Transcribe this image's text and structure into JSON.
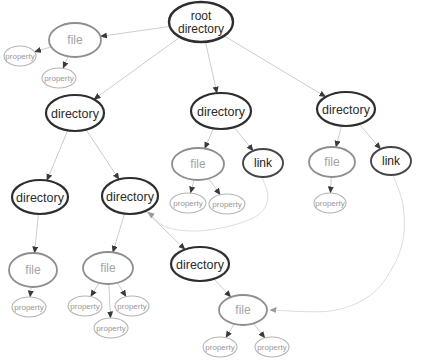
{
  "diagram": {
    "type": "graph",
    "background": "#ffffff",
    "styles": {
      "root": {
        "stroke": "#2e2e2e",
        "width": 2.4,
        "text": "#2b2b2b",
        "font": 12
      },
      "directory": {
        "stroke": "#2e2e2e",
        "width": 2.2,
        "text": "#2b2b2b",
        "font": 12.5
      },
      "file": {
        "stroke": "#8e8e8e",
        "width": 1.8,
        "text": "#a3a3a3",
        "font": 12
      },
      "link": {
        "stroke": "#454545",
        "width": 1.9,
        "text": "#222222",
        "font": 12
      },
      "property": {
        "stroke": "#b4b4b4",
        "width": 1.1,
        "text": "#979797",
        "font": 8
      }
    },
    "edge_style": {
      "stroke": "#c6c6c6",
      "width": 0.9,
      "arrow": "#3a3a3a"
    },
    "link_edge_style": {
      "stroke": "#d8d8d8",
      "width": 0.9,
      "arrow": "#9a9a9a"
    },
    "nodes": [
      {
        "id": "root",
        "type": "root",
        "label": "root directory",
        "lines": [
          "root",
          "directory"
        ],
        "x": 201,
        "y": 22,
        "rx": 32,
        "ry": 20
      },
      {
        "id": "file-1",
        "type": "file",
        "label": "file",
        "x": 75,
        "y": 40,
        "rx": 26,
        "ry": 17
      },
      {
        "id": "property-1a",
        "type": "property",
        "label": "property",
        "x": 20,
        "y": 56,
        "rx": 16,
        "ry": 10
      },
      {
        "id": "property-1b",
        "type": "property",
        "label": "property",
        "x": 59,
        "y": 78,
        "rx": 17,
        "ry": 10
      },
      {
        "id": "directory-1",
        "type": "directory",
        "label": "directory",
        "x": 75,
        "y": 113,
        "rx": 29,
        "ry": 18
      },
      {
        "id": "directory-2",
        "type": "directory",
        "label": "directory",
        "x": 221,
        "y": 111,
        "rx": 30,
        "ry": 18
      },
      {
        "id": "directory-3",
        "type": "directory",
        "label": "directory",
        "x": 346,
        "y": 109,
        "rx": 29,
        "ry": 17
      },
      {
        "id": "directory-4",
        "type": "directory",
        "label": "directory",
        "x": 40,
        "y": 197,
        "rx": 28,
        "ry": 17
      },
      {
        "id": "directory-5",
        "type": "directory",
        "label": "directory",
        "x": 130,
        "y": 196,
        "rx": 28,
        "ry": 18
      },
      {
        "id": "file-2",
        "type": "file",
        "label": "file",
        "x": 198,
        "y": 164,
        "rx": 26,
        "ry": 16
      },
      {
        "id": "link-1",
        "type": "link",
        "label": "link",
        "x": 263,
        "y": 163,
        "rx": 20,
        "ry": 14
      },
      {
        "id": "file-3",
        "type": "file",
        "label": "file",
        "x": 332,
        "y": 162,
        "rx": 23,
        "ry": 15
      },
      {
        "id": "link-2",
        "type": "link",
        "label": "link",
        "x": 391,
        "y": 161,
        "rx": 20,
        "ry": 14
      },
      {
        "id": "property-2a",
        "type": "property",
        "label": "property",
        "x": 188,
        "y": 203,
        "rx": 18,
        "ry": 10
      },
      {
        "id": "property-2b",
        "type": "property",
        "label": "property",
        "x": 227,
        "y": 204,
        "rx": 18,
        "ry": 10
      },
      {
        "id": "property-3a",
        "type": "property",
        "label": "property",
        "x": 330,
        "y": 203,
        "rx": 16,
        "ry": 10
      },
      {
        "id": "file-4",
        "type": "file",
        "label": "file",
        "x": 33,
        "y": 270,
        "rx": 24,
        "ry": 17
      },
      {
        "id": "property-4a",
        "type": "property",
        "label": "property",
        "x": 29,
        "y": 307,
        "rx": 17,
        "ry": 10
      },
      {
        "id": "file-5",
        "type": "file",
        "label": "file",
        "x": 108,
        "y": 268,
        "rx": 25,
        "ry": 16
      },
      {
        "id": "property-5a",
        "type": "property",
        "label": "property",
        "x": 85,
        "y": 306,
        "rx": 17,
        "ry": 10
      },
      {
        "id": "property-5b",
        "type": "property",
        "label": "property",
        "x": 132,
        "y": 306,
        "rx": 17,
        "ry": 10
      },
      {
        "id": "property-5c",
        "type": "property",
        "label": "property",
        "x": 111,
        "y": 328,
        "rx": 17,
        "ry": 10
      },
      {
        "id": "directory-6",
        "type": "directory",
        "label": "directory",
        "x": 200,
        "y": 264,
        "rx": 29,
        "ry": 17
      },
      {
        "id": "file-6",
        "type": "file",
        "label": "file",
        "x": 243,
        "y": 310,
        "rx": 24,
        "ry": 15
      },
      {
        "id": "property-6a",
        "type": "property",
        "label": "property",
        "x": 220,
        "y": 347,
        "rx": 17,
        "ry": 10
      },
      {
        "id": "property-6b",
        "type": "property",
        "label": "property",
        "x": 272,
        "y": 347,
        "rx": 17,
        "ry": 10
      }
    ],
    "edges": [
      {
        "from": "root",
        "to": "file-1",
        "kind": "tree"
      },
      {
        "from": "root",
        "to": "directory-1",
        "kind": "tree"
      },
      {
        "from": "root",
        "to": "directory-2",
        "kind": "tree"
      },
      {
        "from": "root",
        "to": "directory-3",
        "kind": "tree"
      },
      {
        "from": "file-1",
        "to": "property-1a",
        "kind": "tree"
      },
      {
        "from": "file-1",
        "to": "property-1b",
        "kind": "tree"
      },
      {
        "from": "directory-1",
        "to": "directory-4",
        "kind": "tree"
      },
      {
        "from": "directory-1",
        "to": "directory-5",
        "kind": "tree"
      },
      {
        "from": "directory-2",
        "to": "file-2",
        "kind": "tree"
      },
      {
        "from": "directory-2",
        "to": "link-1",
        "kind": "tree"
      },
      {
        "from": "directory-3",
        "to": "file-3",
        "kind": "tree"
      },
      {
        "from": "directory-3",
        "to": "link-2",
        "kind": "tree"
      },
      {
        "from": "file-2",
        "to": "property-2a",
        "kind": "tree"
      },
      {
        "from": "file-2",
        "to": "property-2b",
        "kind": "tree"
      },
      {
        "from": "file-3",
        "to": "property-3a",
        "kind": "tree"
      },
      {
        "from": "directory-4",
        "to": "file-4",
        "kind": "tree"
      },
      {
        "from": "file-4",
        "to": "property-4a",
        "kind": "tree"
      },
      {
        "from": "directory-5",
        "to": "file-5",
        "kind": "tree"
      },
      {
        "from": "directory-5",
        "to": "directory-6",
        "kind": "tree"
      },
      {
        "from": "file-5",
        "to": "property-5a",
        "kind": "tree"
      },
      {
        "from": "file-5",
        "to": "property-5b",
        "kind": "tree"
      },
      {
        "from": "file-5",
        "to": "property-5c",
        "kind": "tree"
      },
      {
        "from": "directory-6",
        "to": "file-6",
        "kind": "tree"
      },
      {
        "from": "file-6",
        "to": "property-6a",
        "kind": "tree"
      },
      {
        "from": "file-6",
        "to": "property-6b",
        "kind": "tree"
      },
      {
        "from": "link-1",
        "to": "directory-5",
        "kind": "link",
        "via": [
          [
            262,
            177
          ],
          [
            268,
            198
          ],
          [
            258,
            215
          ],
          [
            230,
            226
          ],
          [
            196,
            231
          ],
          [
            166,
            227
          ],
          [
            148,
            212
          ]
        ]
      },
      {
        "from": "link-2",
        "to": "file-6",
        "kind": "link",
        "via": [
          [
            393,
            175
          ],
          [
            403,
            205
          ],
          [
            403,
            240
          ],
          [
            390,
            272
          ],
          [
            368,
            297
          ],
          [
            330,
            311
          ],
          [
            270,
            310
          ]
        ]
      }
    ]
  }
}
